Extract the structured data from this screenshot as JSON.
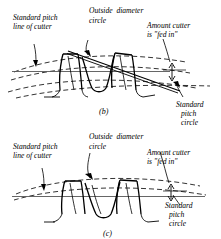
{
  "figure": {
    "background_color": "#ffffff",
    "line_color": "#000000",
    "dashed_color": "#000000",
    "width": 221,
    "height": 239
  },
  "subfigures": [
    {
      "id": "b",
      "caption": "(b)",
      "labels": {
        "pitch_line": "Standard pitch\nline of cutter",
        "pitch_line_l1": "Standard pitch",
        "pitch_line_l2": "line of cutter",
        "outside_diameter": "Outside diameter\ncircle",
        "outside_diameter_l1": "Outside  diameter",
        "outside_diameter_l2": "circle",
        "amount_fed_in_l1": "Amount cutter",
        "amount_fed_in_l2": "is \"fed in\"",
        "pitch_circle_l1": "Standard",
        "pitch_circle_l2": "pitch",
        "pitch_circle_l3": "circle"
      }
    },
    {
      "id": "c",
      "caption": "(c)",
      "labels": {
        "pitch_line_l1": "Standard pitch",
        "pitch_line_l2": "line of cutter",
        "outside_diameter_l1": "Outside  diameter",
        "outside_diameter_l2": "circle",
        "amount_fed_in_l1": "Amount cutter",
        "amount_fed_in_l2": "is \"fed in\"",
        "pitch_circle_l1": "Standard",
        "pitch_circle_l2": "pitch",
        "pitch_circle_l3": "circle"
      }
    }
  ]
}
